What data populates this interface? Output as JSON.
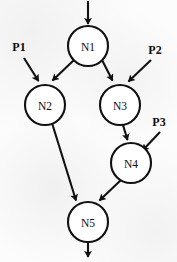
{
  "diagram": {
    "title": "",
    "type": "directed-graph",
    "background_color": "#fcfcfc",
    "stroke_color": "#111111",
    "node_fill": "#ffffff",
    "nodes": [
      {
        "id": "N1",
        "label": "N1",
        "cx": 88,
        "cy": 46,
        "r": 20
      },
      {
        "id": "N2",
        "label": "N2",
        "cx": 45,
        "cy": 105,
        "r": 20
      },
      {
        "id": "N3",
        "label": "N3",
        "cx": 120,
        "cy": 105,
        "r": 20
      },
      {
        "id": "N4",
        "label": "N4",
        "cx": 131,
        "cy": 163,
        "r": 20
      },
      {
        "id": "N5",
        "label": "N5",
        "cx": 88,
        "cy": 222,
        "r": 20
      }
    ],
    "ports": [
      {
        "id": "P1",
        "label": "P1",
        "x": 19,
        "y": 47,
        "target": "N2"
      },
      {
        "id": "P2",
        "label": "P2",
        "x": 155,
        "y": 50,
        "target": "N3"
      },
      {
        "id": "P3",
        "label": "P3",
        "x": 159,
        "y": 122,
        "target": "N4"
      }
    ],
    "edges": [
      {
        "from": "input",
        "to": "N1",
        "kind": "entry"
      },
      {
        "from": "N1",
        "to": "N2",
        "kind": "internal"
      },
      {
        "from": "N1",
        "to": "N3",
        "kind": "internal"
      },
      {
        "from": "P1",
        "to": "N2",
        "kind": "port"
      },
      {
        "from": "P2",
        "to": "N3",
        "kind": "port"
      },
      {
        "from": "N3",
        "to": "N4",
        "kind": "internal"
      },
      {
        "from": "P3",
        "to": "N4",
        "kind": "port"
      },
      {
        "from": "N2",
        "to": "N5",
        "kind": "internal"
      },
      {
        "from": "N4",
        "to": "N5",
        "kind": "internal"
      },
      {
        "from": "N5",
        "to": "output",
        "kind": "exit"
      }
    ]
  }
}
